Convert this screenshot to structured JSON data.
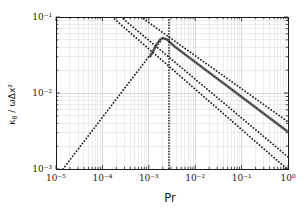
{
  "figure": {
    "xlabel": "Pr",
    "ylabel_kappa": "κ",
    "ylabel_sub": "θ",
    "ylabel_rest": " / ωΔx²"
  },
  "chart_data": {
    "type": "line",
    "title": "",
    "xlabel": "Pr",
    "ylabel": "κθ / ωΔx²",
    "xscale": "log",
    "yscale": "log",
    "xlim": [
      1e-05,
      1
    ],
    "ylim": [
      0.001,
      0.1
    ],
    "grid": true,
    "legend": "none",
    "x_ticks": [
      "10⁻⁵",
      "10⁻⁴",
      "10⁻³",
      "10⁻²",
      "10⁻¹",
      "10⁰"
    ],
    "y_ticks": [
      "10⁻¹",
      "10⁻²",
      "10⁻³"
    ],
    "colors": {
      "axis": "#1a1a1a",
      "grid_minor": "#dcdcdc",
      "grid_major": "#cfcfcf",
      "guide": "#222222",
      "data_line": "#8f8f8f",
      "data_dots": "#3c3c3c"
    },
    "vline": {
      "name": "peak-prandtl-line",
      "x_log10": -2.565,
      "x_value": 0.0027,
      "style": "dotted"
    },
    "series": [
      {
        "name": "ascending-guide-line",
        "style": "dotted",
        "slope_loglog": 0.8,
        "points_log10": [
          [
            -4.85,
            -3.0
          ],
          [
            -2.694,
            -1.276
          ]
        ]
      },
      {
        "name": "numerical-diffusivity-curve",
        "style": "solid-with-dots",
        "peak": {
          "pr": 0.002,
          "value": 0.053
        },
        "end_value_at_pr1": 0.0031,
        "points_log10": [
          [
            -2.97,
            -1.52
          ],
          [
            -2.84,
            -1.37
          ],
          [
            -2.76,
            -1.3
          ],
          [
            -2.694,
            -1.276
          ],
          [
            -2.6,
            -1.3
          ],
          [
            -2.45,
            -1.385
          ],
          [
            -2.2,
            -1.5
          ],
          [
            -1.9,
            -1.638
          ],
          [
            -1.6,
            -1.776
          ],
          [
            -1.3,
            -1.913
          ],
          [
            -1.0,
            -2.051
          ],
          [
            -0.7,
            -2.189
          ],
          [
            -0.4,
            -2.327
          ],
          [
            -0.1,
            -2.465
          ],
          [
            0.0,
            -2.51
          ]
        ]
      },
      {
        "name": "upper-guide-line",
        "style": "dotted",
        "slope_loglog": -0.44,
        "points_log10": [
          [
            -3.17,
            -1.0
          ],
          [
            0.0,
            -2.38
          ]
        ]
      },
      {
        "name": "middle-guide-line",
        "style": "dotted",
        "slope_loglog": -0.51,
        "points_log10": [
          [
            -3.6,
            -1.0
          ],
          [
            0.0,
            -2.84
          ]
        ]
      },
      {
        "name": "lower-guide-line",
        "style": "dotted",
        "slope_loglog": -0.53,
        "points_log10": [
          [
            -3.79,
            -1.0
          ],
          [
            -0.02,
            -3.0
          ]
        ]
      }
    ]
  }
}
